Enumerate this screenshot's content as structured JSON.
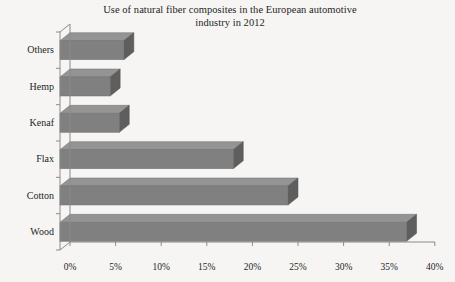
{
  "chart_data": {
    "type": "bar",
    "orientation": "horizontal",
    "title": "Use of natural fiber composites in the European automotive industry in 2012",
    "title_lines": [
      "Use of natural fiber composites in the European automotive",
      "industry in 2012"
    ],
    "categories": [
      "Others",
      "Hemp",
      "Kenaf",
      "Flax",
      "Cotton",
      "Wood"
    ],
    "values": [
      7,
      5.5,
      6.5,
      19,
      25,
      38
    ],
    "value_unit": "%",
    "xlabel": "",
    "ylabel": "",
    "xlim": [
      0,
      40
    ],
    "xticks": [
      0,
      5,
      10,
      15,
      20,
      25,
      30,
      35,
      40
    ],
    "xtick_labels": [
      "0%",
      "5%",
      "10%",
      "15%",
      "20%",
      "25%",
      "30%",
      "35%",
      "40%"
    ],
    "grid": false,
    "legend": false,
    "style": "3d",
    "colors": {
      "bar_front": "#808080",
      "bar_top": "#949494",
      "bar_side": "#5e5e5e",
      "axis": "#8a8a8a",
      "background": "#f6f5f3",
      "text": "#242424"
    }
  }
}
